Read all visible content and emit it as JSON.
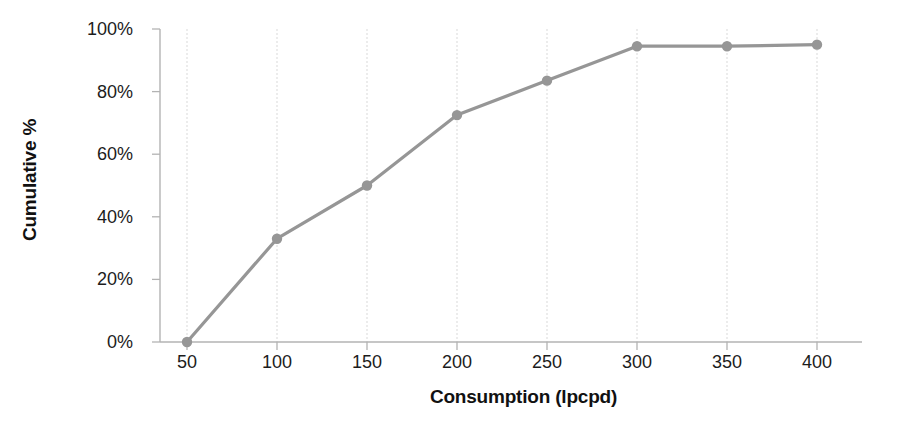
{
  "chart_data": {
    "type": "line",
    "title": "",
    "xlabel": "Consumption (lpcpd)",
    "ylabel": "Cumulative %",
    "x": [
      50,
      100,
      150,
      200,
      250,
      300,
      350,
      400
    ],
    "values": [
      0,
      33,
      50,
      72.5,
      83.5,
      94.5,
      94.5,
      95
    ],
    "categories": [
      "50",
      "100",
      "150",
      "200",
      "250",
      "300",
      "350",
      "400"
    ],
    "xtick_labels": [
      "50",
      "100",
      "150",
      "200",
      "250",
      "300",
      "350",
      "400"
    ],
    "ytick_labels": [
      "0%",
      "20%",
      "40%",
      "60%",
      "80%",
      "100%"
    ],
    "ytick_values": [
      0,
      20,
      40,
      60,
      80,
      100
    ],
    "xlim": [
      50,
      425
    ],
    "ylim": [
      0,
      100
    ],
    "grid": "vertical-only",
    "legend": "none",
    "series": [
      {
        "name": "Cumulative %",
        "values": [
          0,
          33,
          50,
          72.5,
          83.5,
          94.5,
          94.5,
          95
        ]
      }
    ]
  },
  "style": {
    "line_color": "#969696",
    "marker_color": "#969696",
    "gridline_color": "#d9d9d9",
    "axis_color": "#b3b3b3",
    "text_color": "#1c1c1c",
    "background": "#ffffff"
  }
}
